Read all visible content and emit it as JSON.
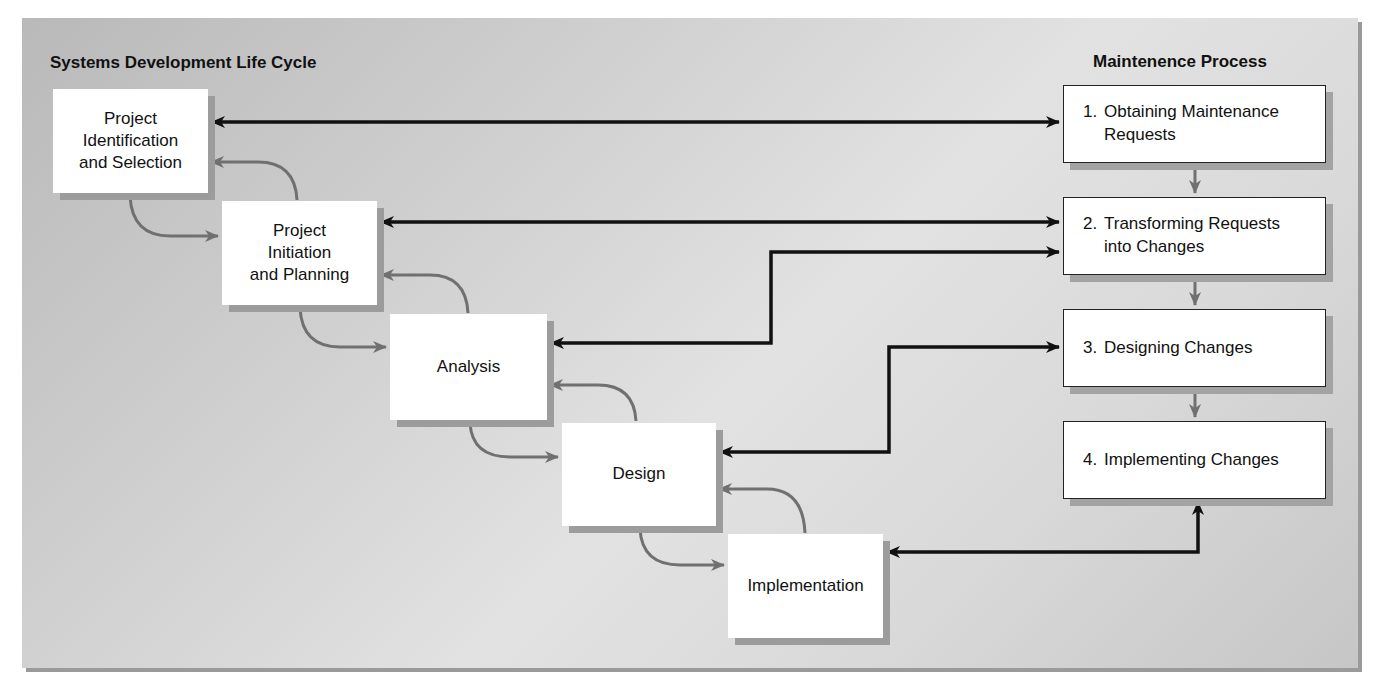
{
  "diagram": {
    "left_title": "Systems Development Life Cycle",
    "right_title": "Maintenence Process",
    "sdlc_phases": [
      {
        "label": "Project\nIdentification\nand Selection"
      },
      {
        "label": "Project\nInitiation\nand Planning"
      },
      {
        "label": "Analysis"
      },
      {
        "label": "Design"
      },
      {
        "label": "Implementation"
      }
    ],
    "maintenance_steps": [
      {
        "number": "1.",
        "label": "Obtaining Maintenance\nRequests"
      },
      {
        "number": "2.",
        "label": "Transforming Requests\ninto Changes"
      },
      {
        "number": "3.",
        "label": "Designing Changes"
      },
      {
        "number": "4.",
        "label": "Implementing Changes"
      }
    ],
    "connections": [
      {
        "from": "Project Identification and Selection",
        "to": "1. Obtaining Maintenance Requests",
        "type": "bidirectional"
      },
      {
        "from": "Project Initiation and Planning",
        "to": "2. Transforming Requests into Changes",
        "type": "bidirectional"
      },
      {
        "from": "Analysis",
        "to": "2. Transforming Requests into Changes",
        "type": "bidirectional"
      },
      {
        "from": "Design",
        "to": "3. Designing Changes",
        "type": "bidirectional"
      },
      {
        "from": "Implementation",
        "to": "4. Implementing Changes",
        "type": "bidirectional"
      }
    ],
    "colors": {
      "panel_background": "#d4d4d4",
      "box_fill": "#ffffff",
      "black_arrow": "#111111",
      "gray_arrow": "#6f6f6f",
      "shadow": "#9c9c9c"
    }
  }
}
